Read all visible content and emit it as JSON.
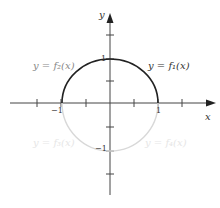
{
  "diagram": {
    "axes": {
      "x_label": "x",
      "y_label": "y"
    },
    "ticks": {
      "x_neg1": "−1",
      "x_pos1": "1",
      "y_pos1": "1",
      "y_neg1": "−1"
    },
    "curves": [
      {
        "name": "f1",
        "label": "y = f₁(x)",
        "region": "upper-right quarter circle",
        "color": "#222222"
      },
      {
        "name": "f2",
        "label": "y = f₂(x)",
        "region": "upper-left quarter circle",
        "color": "#222222"
      },
      {
        "name": "f3",
        "label": "y = f₃(x)",
        "region": "lower-left quarter circle",
        "color": "#d8d8d8"
      },
      {
        "name": "f4",
        "label": "y = f₄(x)",
        "region": "lower-right quarter circle",
        "color": "#d8d8d8"
      }
    ]
  }
}
